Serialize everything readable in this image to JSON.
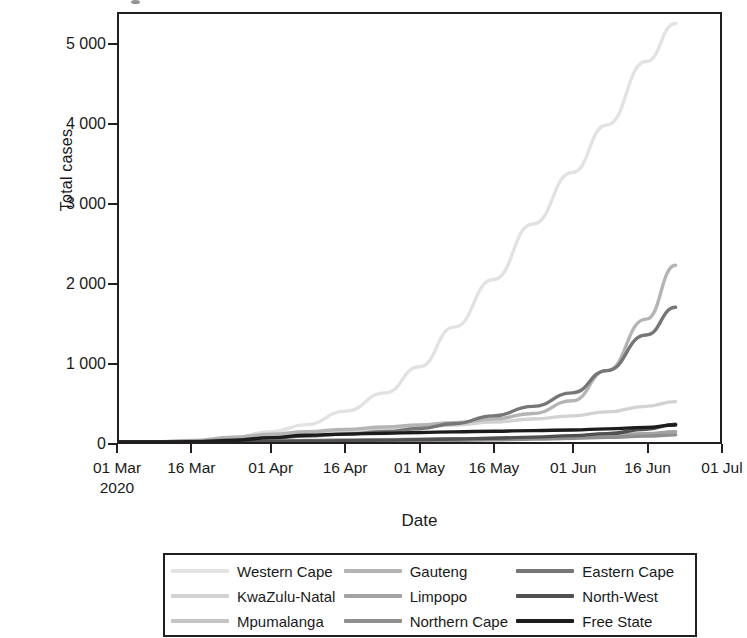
{
  "figure": {
    "background": "#ffffff",
    "frame_color": "#231f20"
  },
  "axes": {
    "y_label": "Total cases",
    "x_label": "Date",
    "y_ticks": [
      "0",
      "1 000",
      "2 000",
      "3 000",
      "4 000",
      "5 000"
    ],
    "x_ticks": [
      {
        "label": "01 Mar",
        "sub": "2020"
      },
      {
        "label": "16 Mar",
        "sub": ""
      },
      {
        "label": "01 Apr",
        "sub": ""
      },
      {
        "label": "16 Apr",
        "sub": ""
      },
      {
        "label": "01 May",
        "sub": ""
      },
      {
        "label": "16 May",
        "sub": ""
      },
      {
        "label": "01 Jun",
        "sub": ""
      },
      {
        "label": "16 Jun",
        "sub": ""
      },
      {
        "label": "01 Jul",
        "sub": ""
      }
    ]
  },
  "legend": {
    "columns": [
      [
        {
          "name": "Western Cape",
          "color": "#e2e2e2"
        },
        {
          "name": "KwaZulu-Natal",
          "color": "#d2d2d2"
        },
        {
          "name": "Mpumalanga",
          "color": "#c4c4c4"
        }
      ],
      [
        {
          "name": "Gauteng",
          "color": "#b4b4b4"
        },
        {
          "name": "Limpopo",
          "color": "#a3a3a3"
        },
        {
          "name": "Northern Cape",
          "color": "#8f8f8f"
        }
      ],
      [
        {
          "name": "Eastern Cape",
          "color": "#767676"
        },
        {
          "name": "North-West",
          "color": "#505050"
        },
        {
          "name": "Free State",
          "color": "#1c1c1c"
        }
      ]
    ]
  },
  "chart_data": {
    "type": "line",
    "title": "",
    "xlabel": "Date",
    "ylabel": "Total cases",
    "xlim": [
      "2020-03-01",
      "2020-07-01"
    ],
    "ylim": [
      0,
      5400
    ],
    "grid": false,
    "legend_position": "bottom",
    "x": [
      "2020-03-01",
      "2020-03-08",
      "2020-03-16",
      "2020-03-24",
      "2020-04-01",
      "2020-04-08",
      "2020-04-16",
      "2020-04-24",
      "2020-05-01",
      "2020-05-08",
      "2020-05-16",
      "2020-05-24",
      "2020-06-01",
      "2020-06-08",
      "2020-06-16",
      "2020-06-22"
    ],
    "series": [
      {
        "name": "Western Cape",
        "color": "#e2e2e2",
        "values": [
          0,
          2,
          15,
          55,
          130,
          220,
          390,
          620,
          950,
          1450,
          2050,
          2750,
          3400,
          4000,
          4800,
          5280
        ]
      },
      {
        "name": "KwaZulu-Natal",
        "color": "#d2d2d2",
        "values": [
          0,
          2,
          12,
          40,
          75,
          105,
          135,
          165,
          190,
          215,
          250,
          290,
          330,
          380,
          450,
          510
        ]
      },
      {
        "name": "Mpumalanga",
        "color": "#c4c4c4",
        "values": [
          0,
          0,
          2,
          6,
          12,
          18,
          24,
          28,
          32,
          38,
          44,
          52,
          62,
          78,
          100,
          125
        ]
      },
      {
        "name": "Gauteng",
        "color": "#b4b4b4",
        "values": [
          0,
          3,
          20,
          60,
          100,
          130,
          160,
          190,
          215,
          245,
          290,
          360,
          520,
          900,
          1550,
          2230
        ]
      },
      {
        "name": "Limpopo",
        "color": "#a3a3a3",
        "values": [
          0,
          0,
          2,
          8,
          14,
          20,
          26,
          30,
          34,
          40,
          46,
          54,
          64,
          80,
          104,
          130
        ]
      },
      {
        "name": "Northern Cape",
        "color": "#8f8f8f",
        "values": [
          0,
          0,
          1,
          3,
          6,
          9,
          12,
          15,
          18,
          22,
          28,
          36,
          46,
          58,
          74,
          90
        ]
      },
      {
        "name": "Eastern Cape",
        "color": "#767676",
        "values": [
          0,
          1,
          8,
          25,
          50,
          75,
          100,
          130,
          170,
          230,
          330,
          450,
          620,
          900,
          1350,
          1700
        ]
      },
      {
        "name": "North-West",
        "color": "#505050",
        "values": [
          0,
          0,
          1,
          4,
          8,
          12,
          18,
          24,
          30,
          38,
          48,
          62,
          80,
          105,
          160,
          225
        ]
      },
      {
        "name": "Free State",
        "color": "#1c1c1c",
        "values": [
          0,
          0,
          3,
          20,
          55,
          85,
          100,
          110,
          120,
          128,
          136,
          144,
          152,
          165,
          185,
          215
        ]
      }
    ]
  }
}
